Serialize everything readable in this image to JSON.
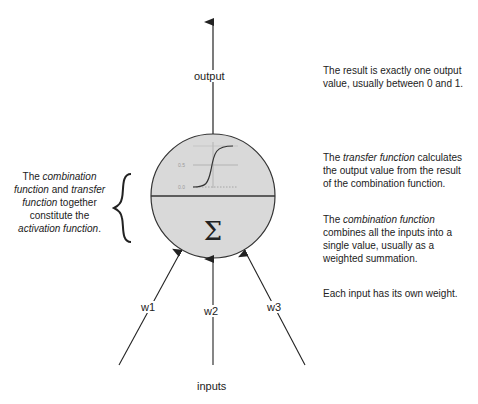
{
  "diagram": {
    "output_label": "output",
    "inputs_label": "inputs",
    "weights": [
      "w1",
      "w2",
      "w3"
    ],
    "sum_symbol": "Σ",
    "transfer_graph": {
      "type": "sigmoid",
      "tick_labels": [
        "0.5",
        "0.0"
      ]
    },
    "colors": {
      "neuron_fill": "#d9d9d9",
      "stroke": "#222222"
    }
  },
  "notes": {
    "output": "The result is exactly one output value, usually between 0 and 1.",
    "transfer": {
      "pre": "The ",
      "em": "transfer function",
      "post": " calculates the output value from the result of the combination function."
    },
    "combination": {
      "pre": "The ",
      "em": "combination function",
      "post": " combines all the inputs into a single value, usually as a weighted summation."
    },
    "weights": "Each input has its own weight.",
    "activation": {
      "t1": "The ",
      "e1": "combination function",
      "t2": " and ",
      "e2": "transfer function",
      "t3": " together constitute the ",
      "e3": "activation function",
      "t4": "."
    }
  }
}
